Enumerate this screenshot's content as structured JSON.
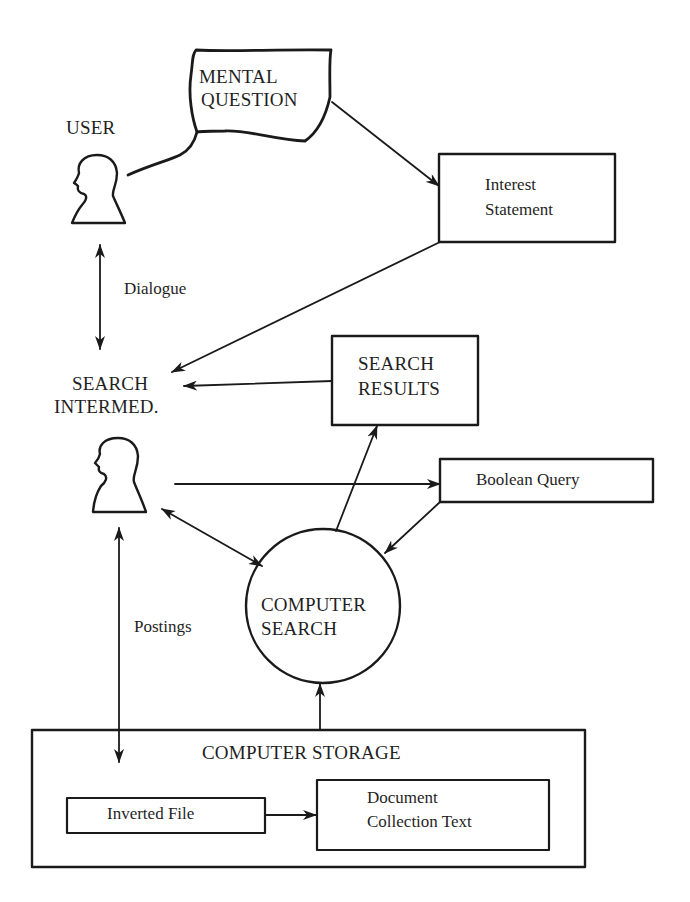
{
  "diagram": {
    "type": "information-retrieval-process-flow",
    "nodes": {
      "user": {
        "label": "USER",
        "shape": "person-silhouette"
      },
      "mental_question": {
        "line1": "MENTAL",
        "line2": "QUESTION",
        "shape": "thought-cloud"
      },
      "interest_statement": {
        "line1": "Interest",
        "line2": "Statement",
        "shape": "box"
      },
      "search_intermediary": {
        "line1": "SEARCH",
        "line2": "INTERMED.",
        "shape": "person-silhouette"
      },
      "search_results": {
        "line1": "SEARCH",
        "line2": "RESULTS",
        "shape": "box"
      },
      "boolean_query": {
        "label": "Boolean Query",
        "shape": "box"
      },
      "computer_search": {
        "line1": "COMPUTER",
        "line2": "SEARCH",
        "shape": "circle"
      },
      "computer_storage": {
        "label": "COMPUTER STORAGE",
        "shape": "container-box"
      },
      "inverted_file": {
        "label": "Inverted File",
        "shape": "box"
      },
      "document_collection": {
        "line1": "Document",
        "line2": "Collection Text",
        "shape": "box"
      }
    },
    "edge_labels": {
      "dialogue": "Dialogue",
      "postings": "Postings"
    },
    "edges": [
      {
        "from": "user",
        "to": "mental_question",
        "style": "thought-tail"
      },
      {
        "from": "mental_question",
        "to": "interest_statement",
        "arrow": "end"
      },
      {
        "from": "user",
        "to": "search_intermediary",
        "arrow": "both",
        "label": "Dialogue"
      },
      {
        "from": "interest_statement",
        "to": "search_intermediary",
        "arrow": "end"
      },
      {
        "from": "search_results",
        "to": "search_intermediary",
        "arrow": "end"
      },
      {
        "from": "search_intermediary",
        "to": "boolean_query",
        "arrow": "end"
      },
      {
        "from": "search_intermediary",
        "to": "computer_search",
        "arrow": "both"
      },
      {
        "from": "boolean_query",
        "to": "computer_search",
        "arrow": "end"
      },
      {
        "from": "computer_search",
        "to": "search_results",
        "arrow": "end"
      },
      {
        "from": "computer_storage",
        "to": "computer_search",
        "arrow": "end"
      },
      {
        "from": "search_intermediary",
        "to": "computer_storage",
        "arrow": "both",
        "label": "Postings"
      },
      {
        "from": "inverted_file",
        "to": "document_collection",
        "arrow": "end"
      }
    ],
    "colors": {
      "ink": "#1a1a1a",
      "background": "#ffffff"
    }
  }
}
